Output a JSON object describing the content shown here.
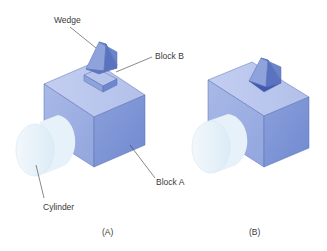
{
  "figure": {
    "panels": [
      {
        "id": "A",
        "caption": "(A)",
        "labels": {
          "wedge": "Wedge",
          "block_b": "Block B",
          "block_a": "Block A",
          "cylinder": "Cylinder"
        }
      },
      {
        "id": "B",
        "caption": "(B)"
      }
    ],
    "colors": {
      "block_top": "#b9c6ec",
      "block_front": "#9eb0e2",
      "block_side": "#7f96d6",
      "cylinder_face": "#eef6fb",
      "cylinder_body": "#e1eef8",
      "wedge_slope": "#8ea2dc",
      "wedge_side": "#6c84cc",
      "wedge_back": "#5a73c0",
      "leader_line": "#3a3a3a"
    }
  }
}
